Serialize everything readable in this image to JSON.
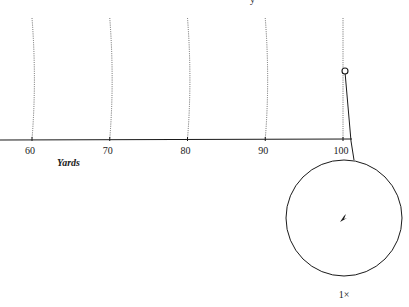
{
  "figure": {
    "top_caption_fragment": "y",
    "axis": {
      "label": "Yards",
      "ticks": [
        60,
        70,
        80,
        90,
        100
      ],
      "tick_labels": [
        "60",
        "70",
        "80",
        "90",
        "100"
      ]
    },
    "marker": {
      "type": "ball",
      "position_yards": 99.8,
      "height_fraction_above_axis": 0.72
    },
    "magnifier": {
      "label": "1×",
      "content": "target-point"
    }
  }
}
